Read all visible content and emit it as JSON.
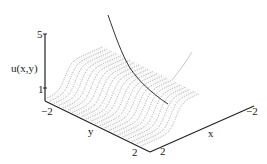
{
  "chart_data": {
    "type": "surface3d",
    "title": "",
    "zlabel": "u(x,y)",
    "xlabel": "x",
    "ylabel": "y",
    "z_ticks": [
      "1",
      "5"
    ],
    "x_ticks": [
      "-2",
      "2"
    ],
    "y_ticks": [
      "-2",
      "2"
    ],
    "zlim": [
      1,
      5
    ],
    "xlim": [
      -2,
      2
    ],
    "ylim": [
      -2,
      2
    ],
    "grid": false,
    "legend": null,
    "series": [
      {
        "name": "surface",
        "style": "dotted mesh lines",
        "color": "#555555"
      },
      {
        "name": "dark curve",
        "style": "solid",
        "color": "#333333"
      },
      {
        "name": "light curve",
        "style": "solid",
        "color": "#bbbbbb"
      }
    ]
  },
  "labels": {
    "z_axis": "u(x,y)",
    "z_tick_top": "5",
    "z_tick_bottom": "1",
    "y_tick_left": "−2",
    "y_tick_right": "2",
    "y_axis": "y",
    "x_tick_near": "2",
    "x_tick_far": "−2",
    "x_axis": "x"
  }
}
